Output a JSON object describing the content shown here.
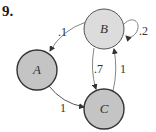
{
  "problem": {
    "number": "9."
  },
  "colors": {
    "node_B_fill": "#dcdcdc",
    "node_AC_fill": "#c4c4c4",
    "node_stroke": "#333333",
    "edge_stroke": "#555555"
  },
  "diagram": {
    "type": "state-transition-diagram",
    "nodes": [
      {
        "id": "A",
        "label": "A"
      },
      {
        "id": "B",
        "label": "B"
      },
      {
        "id": "C",
        "label": "C"
      }
    ],
    "edges": [
      {
        "from": "B",
        "to": "A",
        "label": ".1"
      },
      {
        "from": "B",
        "to": "B",
        "label": ".2"
      },
      {
        "from": "B",
        "to": "C",
        "label": ".7"
      },
      {
        "from": "C",
        "to": "B",
        "label": "1"
      },
      {
        "from": "A",
        "to": "C",
        "label": "1"
      }
    ]
  }
}
